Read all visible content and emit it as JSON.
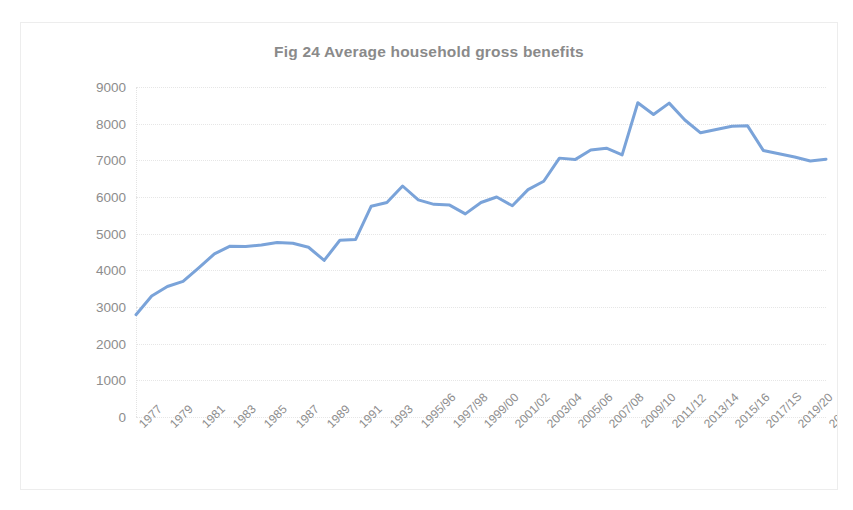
{
  "chart_data": {
    "type": "line",
    "title": "Fig 24 Average household gross benefits",
    "xlabel": "",
    "ylabel": "",
    "ylim": [
      0,
      9000
    ],
    "ytick_step": 1000,
    "yticks": [
      "9000",
      "8000",
      "7000",
      "6000",
      "5000",
      "4000",
      "3000",
      "2000",
      "1000",
      "0"
    ],
    "grid": true,
    "legend": "none",
    "line_color": "#7aa3d9",
    "line_width": 3,
    "marker": "none",
    "categories": [
      "1977",
      "1978",
      "1979",
      "1980",
      "1981",
      "1982",
      "1983",
      "1984",
      "1985",
      "1986",
      "1987",
      "1988",
      "1989",
      "1990",
      "1991",
      "1992",
      "1993",
      "1994/95",
      "1995/96",
      "1996/97",
      "1997/98",
      "1998/99",
      "1999/00",
      "2000/01",
      "2001/02",
      "2002/03",
      "2003/04",
      "2004/05",
      "2005/06",
      "2006/07",
      "2007/08",
      "2008/09",
      "2009/10",
      "2010/11",
      "2011/12",
      "2012/13",
      "2013/14",
      "2014/15",
      "2015/16",
      "2016/17",
      "2017/1S",
      "2018/19",
      "2019/20",
      "2020/21",
      "2021/22"
    ],
    "xtick_labels": [
      "1977",
      "1979",
      "1981",
      "1983",
      "1985",
      "1987",
      "1989",
      "1991",
      "1993",
      "1995/96",
      "1997/98",
      "1999/00",
      "2001/02",
      "2003/04",
      "2005/06",
      "2007/08",
      "2009/10",
      "2011/12",
      "2013/14",
      "2015/16",
      "2017/1S",
      "2019/20",
      "2021/22"
    ],
    "values": [
      2790,
      3300,
      3560,
      3700,
      4070,
      4450,
      4660,
      4650,
      4690,
      4760,
      4740,
      4630,
      4270,
      4820,
      4840,
      5750,
      5850,
      6300,
      5920,
      5800,
      5780,
      5540,
      5850,
      6000,
      5760,
      6200,
      6430,
      7060,
      7020,
      7280,
      7330,
      7150,
      8570,
      8250,
      8560,
      8100,
      7750,
      7840,
      7930,
      7940,
      7270,
      7180,
      7090,
      6980,
      7030
    ]
  },
  "axis": {
    "y_tick_color": "#8d8d8d",
    "x_tick_color": "#8d8d8d",
    "gridline_color": "#e6e6e6"
  }
}
